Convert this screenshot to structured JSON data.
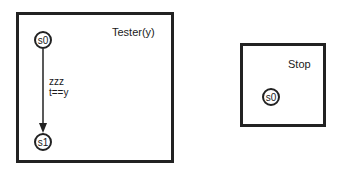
{
  "processes": [
    {
      "name": "Tester(y)",
      "states": [
        "s0",
        "s1"
      ],
      "transitions": [
        {
          "from": "s0",
          "to": "s1",
          "sync": "zzz",
          "guard": "t==y"
        }
      ]
    },
    {
      "name": "Stop",
      "states": [
        "s0"
      ],
      "transitions": []
    }
  ]
}
